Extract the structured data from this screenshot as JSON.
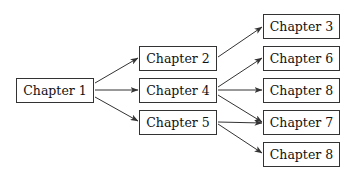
{
  "diagram": {
    "type": "flow",
    "colors": {
      "line": "#333333",
      "border": "#333333",
      "text": "#111111",
      "background": "#ffffff"
    },
    "nodes": [
      {
        "id": "ch1",
        "label": "Chapter 1",
        "x": 16,
        "y": 78,
        "w": 78
      },
      {
        "id": "ch2",
        "label": "Chapter 2",
        "x": 139,
        "y": 46,
        "w": 78
      },
      {
        "id": "ch4",
        "label": "Chapter 4",
        "x": 139,
        "y": 78,
        "w": 78
      },
      {
        "id": "ch5",
        "label": "Chapter 5",
        "x": 139,
        "y": 110,
        "w": 78
      },
      {
        "id": "ch3",
        "label": "Chapter 3",
        "x": 263,
        "y": 14,
        "w": 77
      },
      {
        "id": "ch6",
        "label": "Chapter 6",
        "x": 263,
        "y": 46,
        "w": 77
      },
      {
        "id": "ch8a",
        "label": "Chapter 8",
        "x": 263,
        "y": 78,
        "w": 77
      },
      {
        "id": "ch7",
        "label": "Chapter 7",
        "x": 263,
        "y": 110,
        "w": 77
      },
      {
        "id": "ch8b",
        "label": "Chapter 8",
        "x": 263,
        "y": 142,
        "w": 77
      }
    ],
    "edges": [
      {
        "from": "ch1",
        "to": "ch2",
        "x1": 95,
        "y1": 83,
        "x2": 138,
        "y2": 58
      },
      {
        "from": "ch1",
        "to": "ch4",
        "x1": 95,
        "y1": 90,
        "x2": 138,
        "y2": 90
      },
      {
        "from": "ch1",
        "to": "ch5",
        "x1": 95,
        "y1": 97,
        "x2": 138,
        "y2": 121
      },
      {
        "from": "ch2",
        "to": "ch3",
        "x1": 218,
        "y1": 57,
        "x2": 262,
        "y2": 27
      },
      {
        "from": "ch4",
        "to": "ch6",
        "x1": 218,
        "y1": 87,
        "x2": 262,
        "y2": 58
      },
      {
        "from": "ch4",
        "to": "ch8a",
        "x1": 218,
        "y1": 90,
        "x2": 262,
        "y2": 90
      },
      {
        "from": "ch4",
        "to": "ch7",
        "x1": 218,
        "y1": 95,
        "x2": 262,
        "y2": 122
      },
      {
        "from": "ch5",
        "to": "ch7",
        "x1": 218,
        "y1": 122,
        "x2": 262,
        "y2": 123
      },
      {
        "from": "ch5",
        "to": "ch8b",
        "x1": 218,
        "y1": 124,
        "x2": 262,
        "y2": 153
      }
    ]
  }
}
